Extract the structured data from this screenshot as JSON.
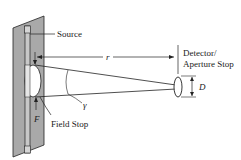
{
  "diagram": {
    "labels": {
      "source": "Source",
      "r": "r",
      "detector_line1": "Detector/",
      "detector_line2": "Aperture Stop",
      "D": "D",
      "gamma": "γ",
      "F": "F",
      "field_stop": "Field Stop"
    },
    "colors": {
      "panel": "#a9a9a9",
      "stroke": "#222222",
      "background": "#ffffff"
    }
  }
}
